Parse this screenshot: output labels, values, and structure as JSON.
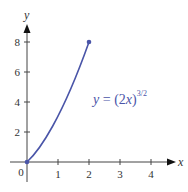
{
  "chart_data": {
    "type": "line",
    "title": "",
    "xlabel": "x",
    "ylabel": "y",
    "xlim": [
      0,
      4.5
    ],
    "ylim": [
      0,
      9
    ],
    "x_ticks": [
      "1",
      "2",
      "3",
      "4"
    ],
    "y_ticks": [
      "2",
      "4",
      "6",
      "8"
    ],
    "origin_label": "0",
    "grid": false,
    "series": [
      {
        "name": "y = (2x)^{3/2}",
        "x": [
          0,
          0.25,
          0.5,
          0.75,
          1,
          1.25,
          1.5,
          1.75,
          2
        ],
        "values": [
          0,
          0.354,
          1,
          1.837,
          2.828,
          3.953,
          5.196,
          6.548,
          8
        ],
        "color": "#4a55a8",
        "endpoints": [
          [
            0,
            0
          ],
          [
            2,
            8
          ]
        ]
      }
    ],
    "annotation": {
      "text": "y = (2x)^{3/2}",
      "lhs": "y",
      "eq": " = ",
      "base": "(2x)",
      "exponent": "3/2"
    }
  }
}
